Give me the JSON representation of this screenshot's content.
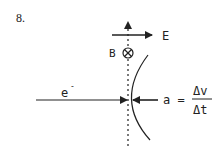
{
  "problem": {
    "number": "8."
  },
  "labels": {
    "electric_field": "E",
    "magnetic_field": "B",
    "electron": "e",
    "electron_charge": "-",
    "acceleration_lhs": "a =",
    "numerator": "Δv",
    "denominator": "Δt"
  },
  "symbols": {
    "magnetic_field_direction": "into-page (⊗)"
  },
  "colors": {
    "ink": "#222222",
    "background": "#ffffff"
  }
}
